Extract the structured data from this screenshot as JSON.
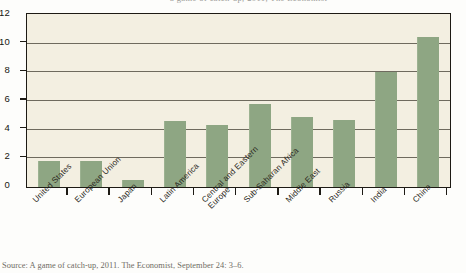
{
  "top_partial_text": "a game of catch-up, 2011, The Economist",
  "caption": "Source: A game of catch-up, 2011. The Economist, September 24: 3–6.",
  "colors": {
    "bar_fill": "#8ea683",
    "plot_background": "#f3efe1",
    "frame_border": "#1d1a14",
    "gridline": "#6e6a5e",
    "page_background": "#fdfdfb"
  },
  "chart_data": {
    "type": "bar",
    "title": "",
    "xlabel": "",
    "ylabel": "",
    "ylim": [
      0,
      12
    ],
    "yticks": [
      0,
      2,
      4,
      6,
      8,
      10,
      12
    ],
    "grid": true,
    "legend": "none",
    "categories": [
      "United States",
      "European Union",
      "Japan",
      "Latin America",
      "Central and Eastern\nEurope",
      "Sub-Saharan Africa",
      "Middle East",
      "Russia",
      "India",
      "China"
    ],
    "values": [
      1.8,
      1.8,
      0.5,
      4.6,
      4.3,
      5.8,
      4.9,
      4.7,
      8.0,
      10.5
    ]
  }
}
